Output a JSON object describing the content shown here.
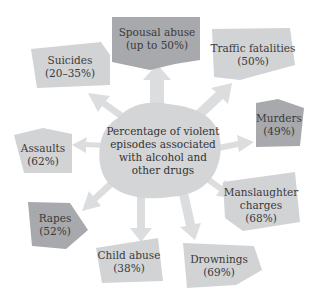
{
  "diagram": {
    "center": {
      "lines": [
        "Percentage of violent",
        "episodes associated",
        "with alcohol and",
        "other drugs"
      ]
    },
    "nodes": [
      {
        "id": "spousal-abuse",
        "lines": [
          "Spousal abuse",
          "(up to 50%)"
        ],
        "shade": "dark"
      },
      {
        "id": "traffic-fatalities",
        "lines": [
          "Traffic fatalities",
          "(50%)"
        ],
        "shade": "light"
      },
      {
        "id": "murders",
        "lines": [
          "Murders",
          "(49%)"
        ],
        "shade": "dark"
      },
      {
        "id": "manslaughter-charges",
        "lines": [
          "Manslaughter",
          "charges",
          "(68%)"
        ],
        "shade": "light"
      },
      {
        "id": "drownings",
        "lines": [
          "Drownings",
          "(69%)"
        ],
        "shade": "light"
      },
      {
        "id": "child-abuse",
        "lines": [
          "Child abuse",
          "(38%)"
        ],
        "shade": "light"
      },
      {
        "id": "rapes",
        "lines": [
          "Rapes",
          "(52%)"
        ],
        "shade": "dark"
      },
      {
        "id": "assaults",
        "lines": [
          "Assaults",
          "(62%)"
        ],
        "shade": "light"
      },
      {
        "id": "suicides",
        "lines": [
          "Suicides",
          "(20–35%)"
        ],
        "shade": "light"
      }
    ],
    "colors": {
      "light_box": "#d2d3d5",
      "dark_box": "#a8a9ac",
      "arrow": "#d9dadc",
      "center_blob": "#d4d5d7",
      "text": "#3a3a3a"
    }
  }
}
